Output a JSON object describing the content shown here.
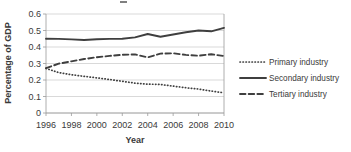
{
  "chart_data": {
    "type": "line",
    "title": "",
    "xlabel": "Year",
    "ylabel": "Percentage of GDP",
    "x": [
      1996,
      1997,
      1998,
      1999,
      2000,
      2001,
      2002,
      2003,
      2004,
      2005,
      2006,
      2007,
      2008,
      2009,
      2010
    ],
    "xtick_labels": [
      "1996",
      "1998",
      "2000",
      "2002",
      "2004",
      "2006",
      "2008",
      "2010"
    ],
    "xticks": [
      1996,
      1998,
      2000,
      2002,
      2004,
      2006,
      2008,
      2010
    ],
    "ytick_labels": [
      "0",
      "0.1",
      "0.2",
      "0.3",
      "0.4",
      "0.5",
      "0.6"
    ],
    "yticks": [
      0,
      0.1,
      0.2,
      0.3,
      0.4,
      0.5,
      0.6
    ],
    "ylim": [
      0,
      0.6
    ],
    "xlim": [
      1996,
      2010
    ],
    "grid": "horizontal",
    "legend_position": "right",
    "series": [
      {
        "name": "Primary industry",
        "style": "dotted",
        "color": "#3f3f3f",
        "values": [
          0.27,
          0.245,
          0.232,
          0.222,
          0.213,
          0.203,
          0.192,
          0.181,
          0.175,
          0.173,
          0.163,
          0.153,
          0.145,
          0.133,
          0.122
        ]
      },
      {
        "name": "Secondary industry",
        "style": "solid",
        "color": "#3f3f3f",
        "values": [
          0.45,
          0.449,
          0.446,
          0.442,
          0.447,
          0.449,
          0.45,
          0.458,
          0.479,
          0.462,
          0.476,
          0.489,
          0.5,
          0.495,
          0.516
        ]
      },
      {
        "name": "Tertiary industry",
        "style": "dashed",
        "color": "#3f3f3f",
        "values": [
          0.272,
          0.299,
          0.313,
          0.327,
          0.338,
          0.346,
          0.353,
          0.355,
          0.337,
          0.36,
          0.362,
          0.352,
          0.347,
          0.356,
          0.345
        ]
      }
    ]
  },
  "axis": {
    "ylabel": "Percentage of GDP",
    "xlabel": "Year"
  },
  "legend": {
    "items": [
      {
        "label": "Primary industry",
        "style": "dotted"
      },
      {
        "label": "Secondary industry",
        "style": "solid"
      },
      {
        "label": "Tertiary industry",
        "style": "dashed"
      }
    ]
  }
}
